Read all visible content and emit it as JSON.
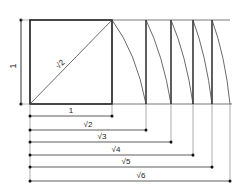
{
  "diagram": {
    "side_label": "1",
    "diagonal_label": "√2",
    "stroke_color": "#1a1a1a",
    "thin_color": "#555555",
    "dimensions": [
      {
        "label": "1",
        "end_x": 112,
        "y": 116
      },
      {
        "label": "√2",
        "end_x": 146,
        "y": 130
      },
      {
        "label": "√3",
        "end_x": 171,
        "y": 142
      },
      {
        "label": "√4",
        "end_x": 193,
        "y": 155
      },
      {
        "label": "√5",
        "end_x": 212,
        "y": 167
      },
      {
        "label": "√6",
        "end_x": 230,
        "y": 181
      }
    ]
  }
}
